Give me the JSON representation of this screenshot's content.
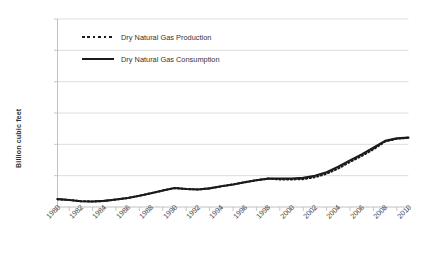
{
  "chart_data": {
    "type": "line",
    "title": "",
    "xlabel": "",
    "ylabel": "Billion cubic feet",
    "ylim": [
      0,
      6000
    ],
    "xlim": [
      1980,
      2010
    ],
    "ytick_labels": [
      "6,000",
      "5,000",
      "4,000",
      "3,000",
      "2,000",
      "1,000",
      "0"
    ],
    "ytick_values": [
      6000,
      5000,
      4000,
      3000,
      2000,
      1000,
      0
    ],
    "xtick_labels": [
      "1980",
      "1982",
      "1984",
      "1986",
      "1988",
      "1990",
      "1992",
      "1994",
      "1996",
      "1998",
      "2000",
      "2002",
      "2004",
      "2006",
      "2008",
      "2010"
    ],
    "xtick_values": [
      1980,
      1982,
      1984,
      1986,
      1988,
      1990,
      1992,
      1994,
      1996,
      1998,
      2000,
      2002,
      2004,
      2006,
      2008,
      2010
    ],
    "minor_tick_interval": 1,
    "grid": "horizontal",
    "legend_position": "upper-left-inside",
    "x": [
      1980,
      1981,
      1982,
      1983,
      1984,
      1985,
      1986,
      1987,
      1988,
      1989,
      1990,
      1991,
      1992,
      1993,
      1994,
      1995,
      1996,
      1997,
      1998,
      1999,
      2000,
      2001,
      2002,
      2003,
      2004,
      2005,
      2006,
      2007,
      2008,
      2009,
      2010
    ],
    "series": [
      {
        "name": "Dry Natural Gas Production",
        "style": "dotted",
        "color": "#1b1b1b",
        "values": [
          250,
          215,
          175,
          170,
          185,
          230,
          270,
          350,
          430,
          520,
          600,
          560,
          555,
          580,
          640,
          700,
          760,
          820,
          880,
          900,
          880,
          880,
          930,
          1020,
          1180,
          1380,
          1560,
          1760,
          2010,
          2130,
          2180
        ]
      },
      {
        "name": "Dry Natural Gas Consumption",
        "style": "solid",
        "color": "#1b1b1b",
        "values": [
          250,
          215,
          175,
          170,
          185,
          230,
          270,
          350,
          430,
          520,
          600,
          560,
          555,
          580,
          640,
          700,
          760,
          820,
          880,
          900,
          880,
          880,
          930,
          1020,
          1180,
          1380,
          1560,
          1760,
          2010,
          2130,
          2180
        ]
      }
    ],
    "production": [
      250,
      225,
      185,
      175,
      195,
      240,
      285,
      360,
      440,
      525,
      605,
      575,
      560,
      595,
      660,
      720,
      790,
      855,
      905,
      880,
      880,
      890,
      950,
      1060,
      1230,
      1440,
      1630,
      1840,
      2090,
      2180,
      2210
    ],
    "consumption": [
      250,
      225,
      185,
      175,
      195,
      240,
      285,
      360,
      440,
      525,
      605,
      575,
      560,
      595,
      660,
      720,
      790,
      855,
      905,
      905,
      905,
      930,
      1000,
      1110,
      1290,
      1490,
      1680,
      1890,
      2110,
      2190,
      2215
    ],
    "units": "Billion cubic feet",
    "note": "World dry natural gas production and consumption, 1980-2010"
  },
  "legend": {
    "items": [
      {
        "label": "Dry Natural Gas Production",
        "style": "dotted"
      },
      {
        "label": "Dry Natural Gas Consumption",
        "style": "solid"
      }
    ]
  }
}
